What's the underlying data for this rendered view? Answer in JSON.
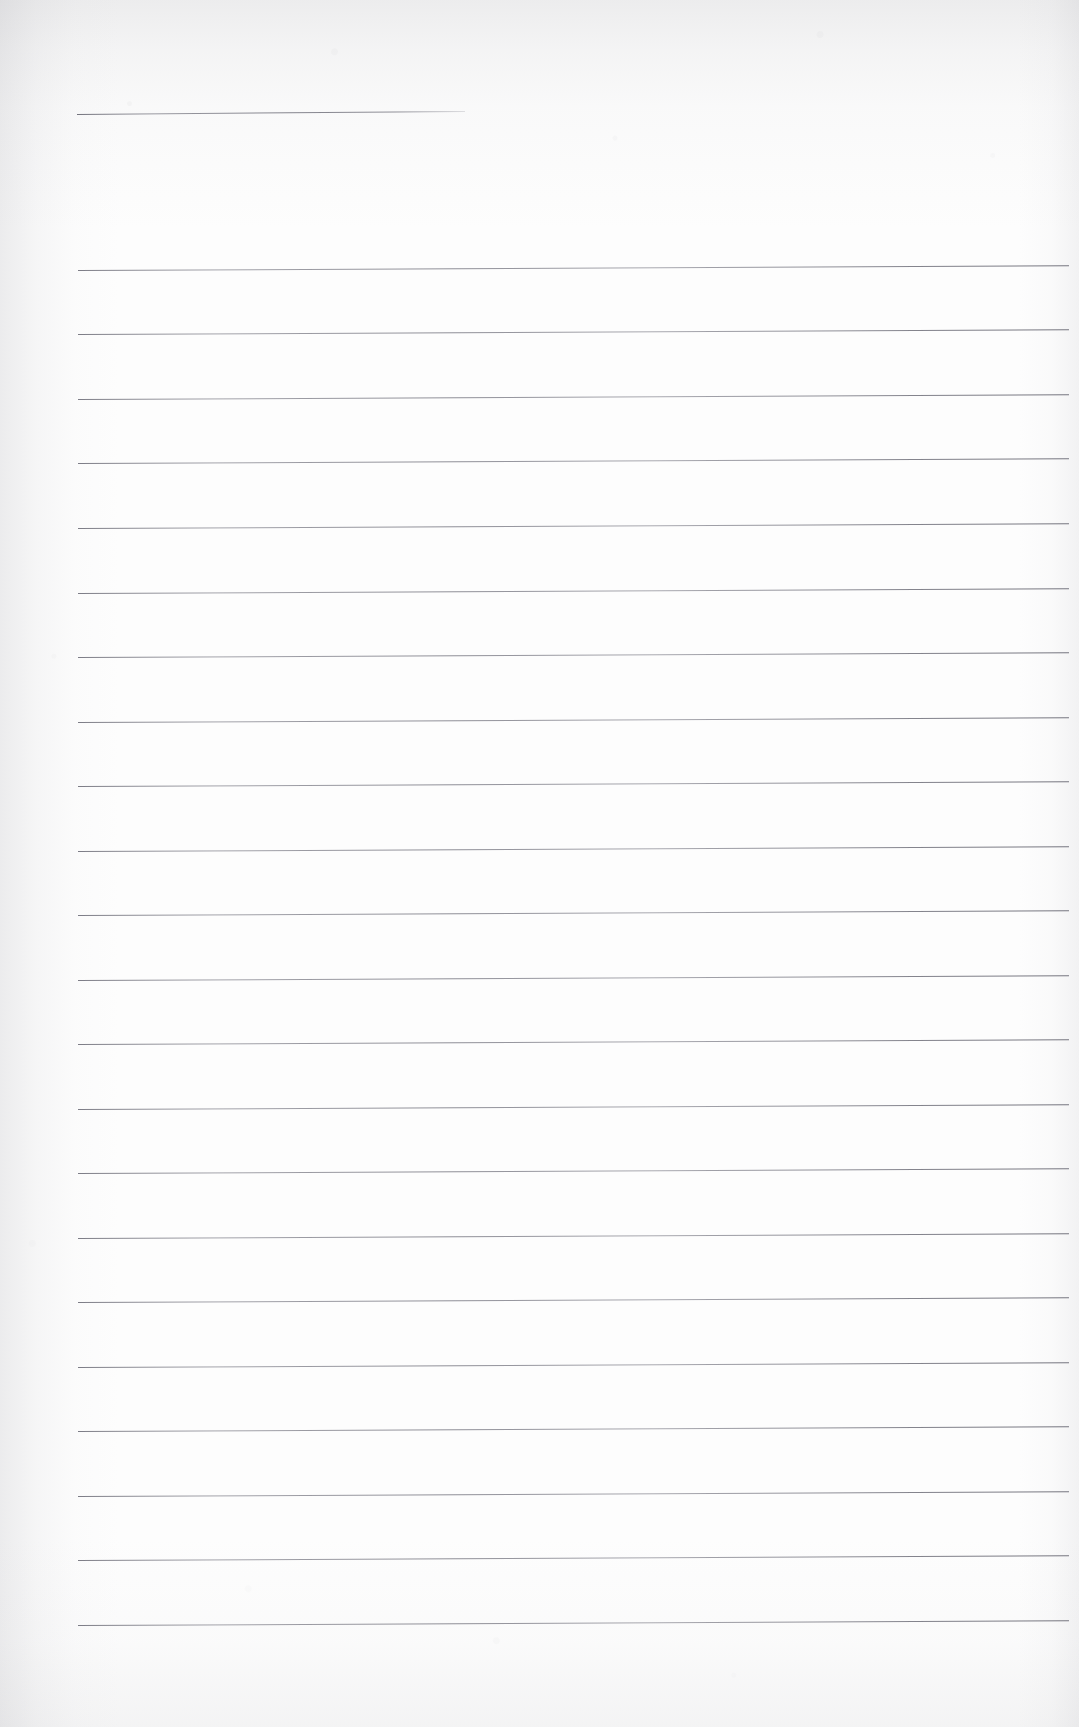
{
  "document": {
    "kind": "scanned-ruled-notebook-page",
    "title_text": "",
    "body_text": "",
    "page_width_px": 1079,
    "page_height_px": 1727,
    "paper_color": "#fdfdfd",
    "rule_color": "#76767f",
    "edge_shadow_color": "#96969c"
  },
  "heading_rule": {
    "label": "",
    "x_px": 77,
    "y_px": 114,
    "width_px": 388,
    "tilt_deg": -0.45
  },
  "ruled_area": {
    "label": "",
    "left_px": 78,
    "right_px": 1069,
    "first_line_y_px": 270,
    "line_spacing_px": 64.6,
    "line_count": 22,
    "tilt_deg": -0.28,
    "lines": [
      {
        "index": 1,
        "y_px": 270,
        "label": ""
      },
      {
        "index": 2,
        "y_px": 334,
        "label": ""
      },
      {
        "index": 3,
        "y_px": 399,
        "label": ""
      },
      {
        "index": 4,
        "y_px": 463,
        "label": ""
      },
      {
        "index": 5,
        "y_px": 528,
        "label": ""
      },
      {
        "index": 6,
        "y_px": 593,
        "label": ""
      },
      {
        "index": 7,
        "y_px": 657,
        "label": ""
      },
      {
        "index": 8,
        "y_px": 722,
        "label": ""
      },
      {
        "index": 9,
        "y_px": 786,
        "label": ""
      },
      {
        "index": 10,
        "y_px": 851,
        "label": ""
      },
      {
        "index": 11,
        "y_px": 915,
        "label": ""
      },
      {
        "index": 12,
        "y_px": 980,
        "label": ""
      },
      {
        "index": 13,
        "y_px": 1044,
        "label": ""
      },
      {
        "index": 14,
        "y_px": 1109,
        "label": ""
      },
      {
        "index": 15,
        "y_px": 1173,
        "label": ""
      },
      {
        "index": 16,
        "y_px": 1238,
        "label": ""
      },
      {
        "index": 17,
        "y_px": 1302,
        "label": ""
      },
      {
        "index": 18,
        "y_px": 1367,
        "label": ""
      },
      {
        "index": 19,
        "y_px": 1431,
        "label": ""
      },
      {
        "index": 20,
        "y_px": 1496,
        "label": ""
      },
      {
        "index": 21,
        "y_px": 1560,
        "label": ""
      },
      {
        "index": 22,
        "y_px": 1625,
        "label": ""
      }
    ]
  }
}
